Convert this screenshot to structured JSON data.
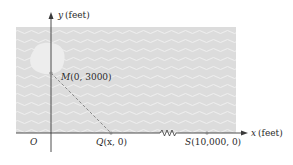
{
  "diagram": {
    "y_axis_label": "y (feet)",
    "x_axis_label": "x (feet)",
    "origin_label": "O",
    "points": {
      "M": {
        "name": "M",
        "coords": "(0, 3000)"
      },
      "Q": {
        "name": "Q",
        "coords": "(x, 0)"
      },
      "S": {
        "name": "S",
        "coords": "(10,000, 0)"
      }
    },
    "colors": {
      "sea": "#dcdcdc",
      "island": "#ececec",
      "axis": "#3a3a3a",
      "path": "#8a8a8a",
      "point": "#888888"
    }
  }
}
